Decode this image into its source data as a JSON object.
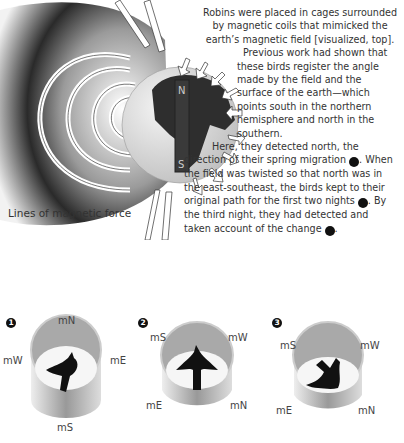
{
  "diagram": {
    "field_caption": "Lines of magnetic force",
    "magnet": {
      "north_label": "N",
      "south_label": "S"
    },
    "colors": {
      "magnet": "#3a3a3a",
      "land": "#2e2e2e",
      "globe": "#d8d8d8",
      "field_dark": "#1a1a1a"
    }
  },
  "text": {
    "p1": "Robins were placed in cages surrounded by magnetic coils that mimicked the earth’s magnetic field [visualized, top].",
    "p2": "Previous work had shown that these birds register the angle made by the field and the surface of the earth—which points south in the northern hemisphere and north in the southern.",
    "p3a": "Here, they detected north, the direction of their spring migration ",
    "p3b": ". When the field was twisted so that north was in the east-southeast, the birds kept to their original path for the first two nights ",
    "p3c": ". By the third night, they had detected and taken account of the change ",
    "p3d": ".",
    "badge1": "1",
    "badge2": "2",
    "badge3": "3"
  },
  "cages": [
    {
      "number": "1",
      "labels": {
        "top": "mN",
        "left": "mW",
        "right": "mE",
        "bottom": "mS"
      },
      "bird_heading": "north-east"
    },
    {
      "number": "2",
      "labels": {
        "top_left": "mS",
        "top_right": "mW",
        "bottom_left": "mE",
        "bottom_right": "mN"
      },
      "bird_heading": "north"
    },
    {
      "number": "3",
      "labels": {
        "top_left": "mS",
        "top_right": "mW",
        "bottom_left": "mE",
        "bottom_right": "mN"
      },
      "bird_heading": "south-east"
    }
  ]
}
